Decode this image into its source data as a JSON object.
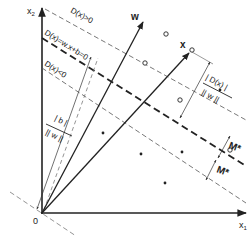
{
  "diagram": {
    "axes": {
      "x1_label": "x",
      "x1_sub": "1",
      "x2_label": "x",
      "x2_sub": "2",
      "origin_label": "0"
    },
    "vectors": {
      "w_label": "w",
      "x_label": "x"
    },
    "lines": {
      "positive_label": "D(x)>0",
      "hyperplane_label": "D(x)=w.x+b=0",
      "negative_label": "D(x)<0"
    },
    "annotations": {
      "bias_num": "| b |",
      "bias_den": "|| w ||",
      "dist_num": "| D(x) |",
      "dist_den": "|| w ||",
      "margin_upper": "M*",
      "margin_lower": "M*"
    },
    "colors": {
      "ink": "#222222",
      "background": "#ffffff"
    },
    "points": {
      "circles": [
        [
          166,
          34
        ],
        [
          145,
          63
        ],
        [
          180,
          100
        ],
        [
          230,
          152
        ],
        [
          121,
          44
        ],
        [
          190,
          50
        ]
      ],
      "dots": [
        [
          103,
          133
        ],
        [
          141,
          154
        ],
        [
          183,
          152
        ],
        [
          165,
          183
        ],
        [
          220,
          90
        ]
      ]
    }
  }
}
